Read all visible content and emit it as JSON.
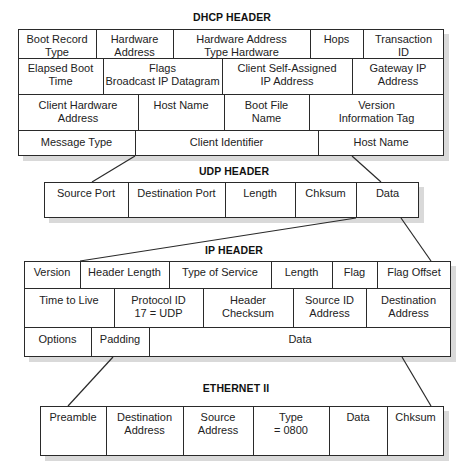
{
  "diagram": {
    "type": "protocol-encapsulation",
    "sections": [
      {
        "id": "dhcp",
        "title": "DHCP HEADER",
        "rows": [
          [
            "Boot Record\nType",
            "Hardware\nAddress",
            "Hardware Address\nType Hardware",
            "Hops",
            "Transaction\nID"
          ],
          [
            "Elapsed Boot\nTime",
            "Flags\nBroadcast IP Datagram",
            "Client Self-Assigned\nIP Address",
            "Gateway IP\nAddress"
          ],
          [
            "Client Hardware\nAddress",
            "Host Name",
            "Boot File\nName",
            "Version\nInformation Tag"
          ],
          [
            "Message Type",
            "Client Identifier",
            "Host Name"
          ]
        ]
      },
      {
        "id": "udp",
        "title": "UDP HEADER",
        "rows": [
          [
            "Source Port",
            "Destination Port",
            "Length",
            "Chksum",
            "Data"
          ]
        ]
      },
      {
        "id": "ip",
        "title": "IP HEADER",
        "rows": [
          [
            "Version",
            "Header Length",
            "Type of Service",
            "Length",
            "Flag",
            "Flag Offset"
          ],
          [
            "Time to Live",
            "Protocol ID\n17 = UDP",
            "Header\nChecksum",
            "Source ID\nAddress",
            "Destination\nAddress"
          ],
          [
            "Options",
            "Padding",
            "Data"
          ]
        ]
      },
      {
        "id": "ethernet",
        "title": "ETHERNET II",
        "rows": [
          [
            "Preamble",
            "Destination\nAddress",
            "Source\nAddress",
            "Type\n= 0800",
            "Data",
            "Chksum"
          ]
        ]
      }
    ],
    "connectors": [
      {
        "from": "dhcp",
        "to": "udp.Data",
        "note": "DHCP header encapsulated in UDP Data field"
      },
      {
        "from": "udp",
        "to": "ip.Data",
        "note": "UDP datagram encapsulated in IP Data field"
      },
      {
        "from": "ip",
        "to": "ethernet.Data",
        "note": "IP packet encapsulated in Ethernet Data field"
      }
    ],
    "colors": {
      "line": "#2a2a2a",
      "shadow": "#d9d9d9",
      "text": "#222222",
      "background": "#ffffff"
    }
  }
}
